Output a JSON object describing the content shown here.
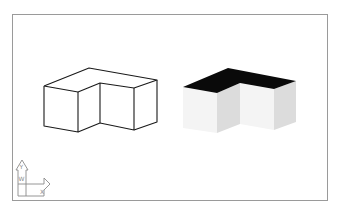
{
  "viewport": {
    "frame": {
      "x1": 12,
      "y1": 14,
      "x2": 327,
      "y2": 200,
      "color": "#9a9a9a"
    },
    "background": "#ffffff"
  },
  "models": [
    {
      "name": "wireframe-l-block",
      "style": "wireframe",
      "line_color": "#1a1a1a",
      "vertices": {
        "top_back": [
          89,
          68
        ],
        "left_top": [
          44,
          86
        ],
        "front_top": [
          78,
          92
        ],
        "notch_top": [
          100,
          83
        ],
        "mid_top": [
          134,
          88
        ],
        "right_top": [
          157,
          80
        ],
        "left_bottom": [
          44,
          126
        ],
        "front_bottom": [
          78,
          132
        ],
        "notch_bottom": [
          100,
          123
        ],
        "mid_bottom": [
          134,
          130
        ],
        "right_bottom": [
          157,
          122
        ]
      }
    },
    {
      "name": "shaded-l-block",
      "style": "shaded",
      "top_color": "#0a0a0a",
      "left_face_color": "#f4f4f4",
      "right_face_color": "#dcdcdc",
      "vertices": {
        "top_back": [
          228,
          68
        ],
        "left_top": [
          183,
          87
        ],
        "front_top": [
          217,
          93
        ],
        "notch_top": [
          240,
          83
        ],
        "mid_top": [
          274,
          89
        ],
        "right_top": [
          296,
          81
        ],
        "left_bottom": [
          183,
          128
        ],
        "front_bottom": [
          217,
          133
        ],
        "notch_bottom": [
          240,
          124
        ],
        "mid_bottom": [
          274,
          130
        ],
        "right_bottom": [
          296,
          122
        ]
      }
    }
  ],
  "ucs_icon": {
    "y_label": "Y",
    "x_label": "X",
    "w_label": "W",
    "color": "#8a8a8a"
  }
}
